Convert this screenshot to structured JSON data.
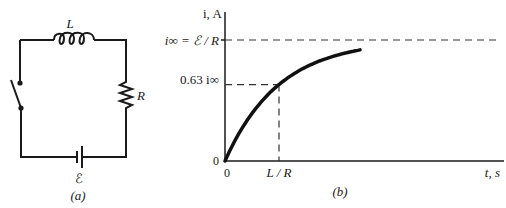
{
  "circuit": {
    "inductor_label": "L",
    "resistor_label": "R",
    "emf_label": "ℰ",
    "caption": "(a)"
  },
  "graph": {
    "caption": "(b)",
    "y_axis_label": "i, A",
    "x_axis_label": "t, s",
    "y_ticks": {
      "asymptote": "i∞ = ℰ / R",
      "point63": "0.63 i∞",
      "origin_y": "0"
    },
    "x_ticks": {
      "origin_x": "0",
      "tau": "L / R"
    }
  },
  "chart_data": {
    "type": "line",
    "title": "",
    "xlabel": "t, s",
    "ylabel": "i, A",
    "x_units": "time constants (L/R)",
    "y_units": "fraction of i∞",
    "x_tick_labels": [
      "0",
      "L / R"
    ],
    "y_tick_labels": [
      "0",
      "0.63 i∞",
      "i∞ = ℰ / R"
    ],
    "xlim": [
      0,
      3.4
    ],
    "ylim": [
      0,
      1.0
    ],
    "series": [
      {
        "name": "i(t)",
        "x": [
          0,
          0.25,
          0.5,
          0.75,
          1.0,
          1.25,
          1.5,
          1.75,
          2.0,
          2.25,
          2.5
        ],
        "y": [
          0,
          0.221,
          0.393,
          0.528,
          0.632,
          0.713,
          0.777,
          0.826,
          0.865,
          0.895,
          0.918
        ]
      }
    ],
    "reference_lines": [
      {
        "type": "horizontal",
        "y": 1.0,
        "label": "i∞ = ℰ / R",
        "style": "dashed"
      },
      {
        "type": "horizontal",
        "y": 0.632,
        "label": "0.63 i∞",
        "style": "dashed",
        "x_end": 1.0
      },
      {
        "type": "vertical",
        "x": 1.0,
        "label": "L / R",
        "style": "dashed",
        "y_end": 0.632
      }
    ],
    "grid": false,
    "legend": "none"
  }
}
